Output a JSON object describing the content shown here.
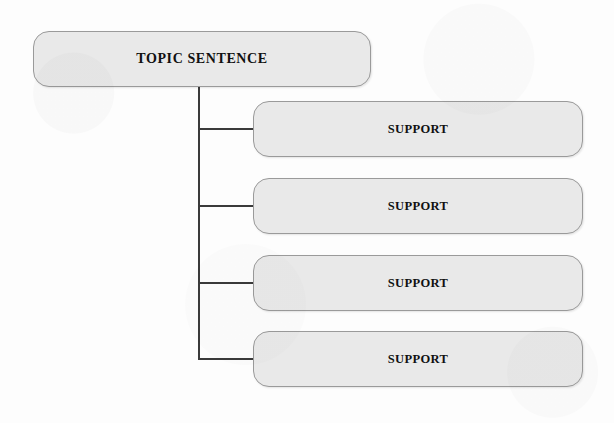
{
  "diagram": {
    "type": "hierarchy-tree",
    "background_color": "#fdfdfd",
    "node_fill_color": "#e9e9e9",
    "node_border_color": "#9a9a9a",
    "connector_color": "#3a3a3a",
    "text_color": "#111111",
    "root": {
      "id": "topic",
      "label": "TOPIC SENTENCE"
    },
    "children": [
      {
        "id": "support-1",
        "label": "SUPPORT"
      },
      {
        "id": "support-2",
        "label": "SUPPORT"
      },
      {
        "id": "support-3",
        "label": "SUPPORT"
      },
      {
        "id": "support-4",
        "label": "SUPPORT"
      }
    ],
    "connectors": {
      "trunk_x": 199,
      "trunk_top_y": 87,
      "trunk_bottom_y": 359,
      "branch_end_x": 253,
      "branch_y_values": [
        129,
        206,
        283,
        359
      ]
    }
  }
}
